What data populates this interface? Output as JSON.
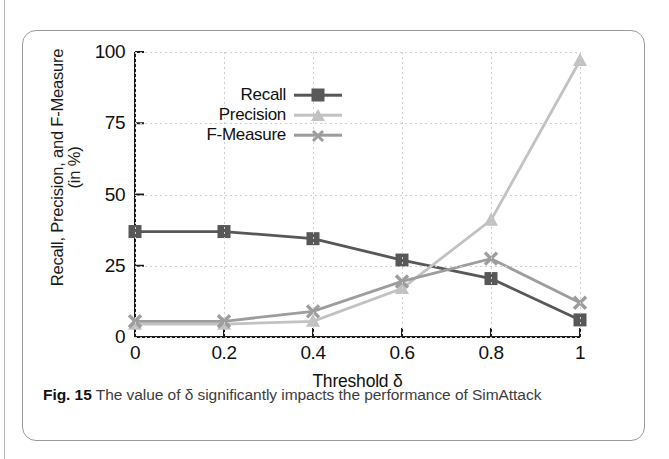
{
  "figure": {
    "caption_label": "Fig. 15",
    "caption_text": "The value of δ significantly impacts the performance of SimAttack"
  },
  "colors": {
    "recall": "#585858",
    "precision": "#c2c2c2",
    "fmeasure": "#9d9d9d",
    "axis": "#1b1b1b",
    "grid": "#cfcfcf",
    "frame": "#9a9a9a"
  },
  "chart_data": {
    "type": "line",
    "title": "",
    "xlabel": "Threshold δ",
    "ylabel": "Recall, Precision, and F-Measure (in %)",
    "ylabel_line1": "Recall, Precision, and F-Measure",
    "ylabel_line2": "(in %)",
    "x": [
      0,
      0.2,
      0.4,
      0.6,
      0.8,
      1
    ],
    "xtick_labels": [
      "0",
      "0.2",
      "0.4",
      "0.6",
      "0.8",
      "1"
    ],
    "ytick_labels": [
      "0",
      "25",
      "50",
      "75",
      "100"
    ],
    "yticks": [
      0,
      25,
      50,
      75,
      100
    ],
    "xlim": [
      0,
      1
    ],
    "ylim": [
      0,
      100
    ],
    "grid": true,
    "legend_position": "top-left-inside",
    "series": [
      {
        "name": "Recall",
        "marker": "square",
        "color": "#585858",
        "values": [
          37,
          37,
          34.5,
          27,
          20.5,
          6
        ]
      },
      {
        "name": "Precision",
        "marker": "triangle",
        "color": "#c2c2c2",
        "values": [
          4.5,
          4.5,
          5.5,
          17,
          41,
          97
        ]
      },
      {
        "name": "F-Measure",
        "marker": "cross",
        "color": "#9d9d9d",
        "values": [
          5.5,
          5.5,
          9,
          19.5,
          27.5,
          12
        ]
      }
    ]
  }
}
